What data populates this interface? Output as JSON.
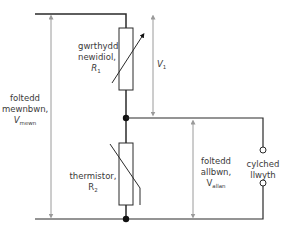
{
  "diagram": {
    "type": "voltage divider circuit",
    "colors": {
      "wire": "#2a2a2a",
      "arrow": "#9a9a9a",
      "text": "#3a3a3a",
      "junction": "#111111"
    },
    "components": {
      "r1": {
        "name_line1": "gwrthydd",
        "name_line2": "newidiol,",
        "symbol": "R",
        "symbol_sub": "1"
      },
      "r2": {
        "name_line1": "thermistor,",
        "symbol": "R",
        "symbol_sub": "2"
      }
    },
    "voltages": {
      "v_in": {
        "line1": "foltedd",
        "line2": "mewnbwn,",
        "symbol": "V",
        "symbol_sub": "mewn"
      },
      "v1": {
        "symbol": "V",
        "symbol_sub": "1"
      },
      "v_out": {
        "line1": "foltedd",
        "line2": "allbwn,",
        "symbol": "V",
        "symbol_sub": "allan"
      }
    },
    "output": {
      "line1": "cylched",
      "line2": "llwyth"
    }
  }
}
